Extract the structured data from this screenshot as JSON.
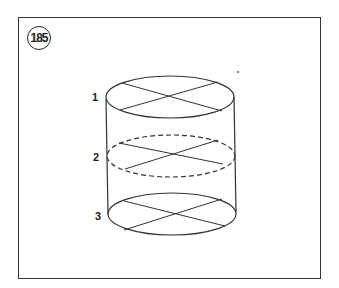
{
  "figure": {
    "number": "185",
    "labels": [
      {
        "id": "1",
        "text": "1"
      },
      {
        "id": "2",
        "text": "2"
      },
      {
        "id": "3",
        "text": "3"
      }
    ]
  },
  "colors": {
    "stroke": "#333333",
    "background": "#ffffff"
  }
}
